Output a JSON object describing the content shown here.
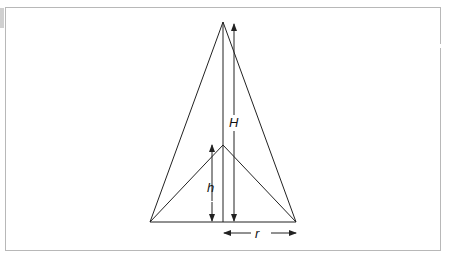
{
  "diagram": {
    "title": "",
    "labels": {
      "outer_height": "H",
      "inner_height": "h",
      "radius": "r"
    },
    "shapes": {
      "outer_triangle": {
        "apex": [
          223,
          22
        ],
        "base_left": [
          150,
          222
        ],
        "base_right": [
          296,
          222
        ]
      },
      "inner_triangle": {
        "apex": [
          223,
          145
        ],
        "base_left": [
          150,
          222
        ],
        "base_right": [
          296,
          222
        ]
      },
      "center_axis": {
        "from": [
          223,
          22
        ],
        "to": [
          223,
          222
        ]
      }
    },
    "colors": {
      "line": "#222222",
      "frame": "#b8b8b8"
    }
  }
}
